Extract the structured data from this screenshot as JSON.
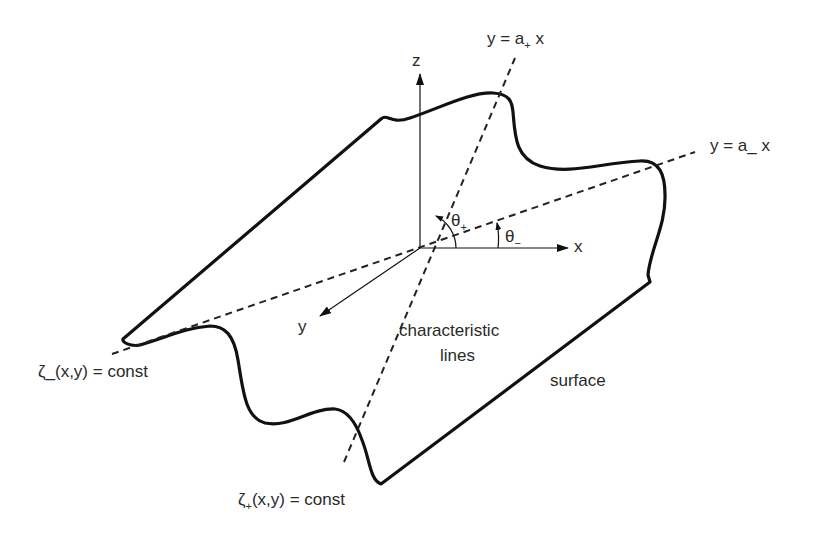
{
  "diagram": {
    "axes": {
      "z_label": "z",
      "x_label": "x",
      "y_label": "y"
    },
    "lines": {
      "plus_line": {
        "prefix": "y = a",
        "subscript": "+",
        "suffix": " x"
      },
      "minus_line": {
        "prefix": "y = a",
        "subscript": "_",
        "suffix": " x"
      }
    },
    "angles": {
      "theta_plus": {
        "symbol": "θ",
        "subscript": "+"
      },
      "theta_minus": {
        "symbol": "θ",
        "subscript": "−"
      }
    },
    "labels": {
      "zeta_minus": {
        "symbol": "ζ",
        "subscript": "_",
        "rest": "(x,y) = const"
      },
      "zeta_plus": {
        "symbol": "ζ",
        "subscript": "+",
        "rest": "(x,y) = const"
      },
      "characteristic_line1": "characteristic",
      "characteristic_line2": "lines",
      "surface": "surface"
    },
    "colors": {
      "stroke": "#111111",
      "text": "#2a2a2a",
      "background": "#ffffff"
    }
  }
}
